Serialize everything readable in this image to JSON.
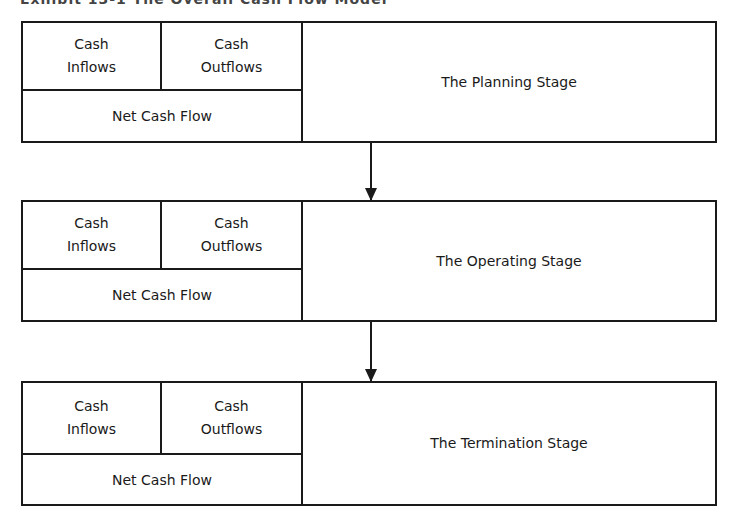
{
  "title": "Exhibit 13-1  The Overall Cash Flow Model",
  "stages": [
    {
      "inflows": [
        "Cash",
        "Inflows"
      ],
      "outflows": [
        "Cash",
        "Outflows"
      ],
      "net": "Net Cash Flow",
      "name": "The Planning Stage"
    },
    {
      "inflows": [
        "Cash",
        "Inflows"
      ],
      "outflows": [
        "Cash",
        "Outflows"
      ],
      "net": "Net Cash Flow",
      "name": "The Operating Stage"
    },
    {
      "inflows": [
        "Cash",
        "Inflows"
      ],
      "outflows": [
        "Cash",
        "Outflows"
      ],
      "net": "Net Cash Flow",
      "name": "The Termination Stage"
    }
  ],
  "flow": [
    "The Planning Stage",
    "The Operating Stage",
    "The Termination Stage"
  ],
  "colors": {
    "line": "#1a1a1a",
    "background": "#ffffff"
  }
}
